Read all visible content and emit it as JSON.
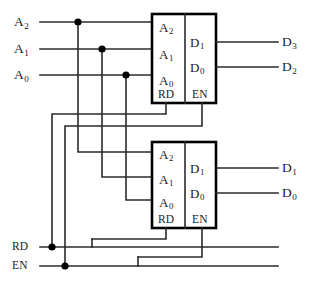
{
  "diagram": {
    "inputs": {
      "address": [
        {
          "name": "address-a2",
          "label": "A",
          "sub": "2"
        },
        {
          "name": "address-a1",
          "label": "A",
          "sub": "1"
        },
        {
          "name": "address-a0",
          "label": "A",
          "sub": "0"
        }
      ],
      "control": [
        {
          "name": "control-rd",
          "label": "RD"
        },
        {
          "name": "control-en",
          "label": "EN"
        }
      ]
    },
    "outputs": [
      {
        "name": "output-d3",
        "label": "D",
        "sub": "3"
      },
      {
        "name": "output-d2",
        "label": "D",
        "sub": "2"
      },
      {
        "name": "output-d1",
        "label": "D",
        "sub": "1"
      },
      {
        "name": "output-d0",
        "label": "D",
        "sub": "0"
      }
    ],
    "chips": [
      {
        "name": "memory-chip-upper",
        "address_pins": [
          {
            "label": "A",
            "sub": "2"
          },
          {
            "label": "A",
            "sub": "1"
          },
          {
            "label": "A",
            "sub": "0"
          }
        ],
        "data_pins": [
          {
            "label": "D",
            "sub": "1"
          },
          {
            "label": "D",
            "sub": "0"
          }
        ],
        "control_pins": [
          {
            "label": "RD"
          },
          {
            "label": "EN"
          }
        ]
      },
      {
        "name": "memory-chip-lower",
        "address_pins": [
          {
            "label": "A",
            "sub": "2"
          },
          {
            "label": "A",
            "sub": "1"
          },
          {
            "label": "A",
            "sub": "0"
          }
        ],
        "data_pins": [
          {
            "label": "D",
            "sub": "1"
          },
          {
            "label": "D",
            "sub": "0"
          }
        ],
        "control_pins": [
          {
            "label": "RD"
          },
          {
            "label": "EN"
          }
        ]
      }
    ],
    "colors": {
      "wire": "#2b2b2b",
      "chip_outline": "#000000",
      "text": "#1a1a1a",
      "background": "#ffffff"
    }
  }
}
